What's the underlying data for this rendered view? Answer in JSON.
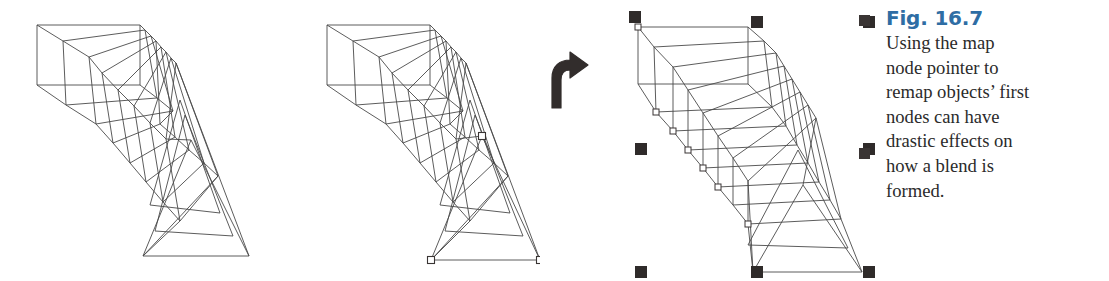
{
  "figure": {
    "title": "Fig. 16.7",
    "caption_lines": [
      "Using the map",
      "node pointer to",
      "remap objects’ first",
      "nodes can have",
      "drastic effects on",
      "how a blend is",
      "formed."
    ],
    "caption_full": "Using the map node pointer to remap objects’ first nodes can have drastic effects on how a blend is formed.",
    "title_color": "#2e6da4",
    "body_color": "#2b2b2b",
    "stroke_color": "#4a4a4a",
    "handle_color": "#2f2b2a",
    "background": "#ffffff"
  },
  "panels": [
    {
      "id": "panel-before",
      "name": "blend-before",
      "label": "Blend before remapping first nodes",
      "steps": 7,
      "start_shape": "rectangle",
      "end_shape": "triangle",
      "has_node_markers": false,
      "has_selection_handles": false
    },
    {
      "id": "panel-nodes",
      "name": "blend-with-node-markers",
      "label": "Triangle first-node markers shown",
      "steps": 7,
      "start_shape": "rectangle",
      "end_shape": "triangle",
      "has_node_markers": true,
      "node_marker_count": 3,
      "has_selection_handles": false
    },
    {
      "id": "panel-after",
      "name": "blend-after",
      "label": "Blend after remapping first nodes",
      "steps": 7,
      "start_shape": "rectangle",
      "end_shape": "triangle",
      "has_node_markers": true,
      "node_marker_count": 7,
      "has_selection_handles": true,
      "selection_handle_count": 8
    }
  ],
  "arrow": {
    "name": "curved-arrow-right",
    "label": "leads to",
    "color": "#322d2c"
  },
  "bullets": {
    "color": "#3a3534",
    "count": 2
  }
}
